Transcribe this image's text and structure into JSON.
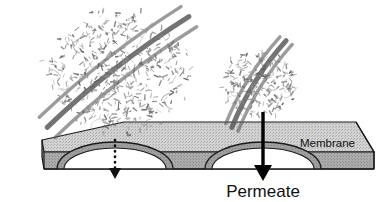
{
  "figure": {
    "labels": {
      "membrane": "Membrane",
      "permeate": "Permeate"
    },
    "colors": {
      "background": "#ffffff",
      "slab_top_face": "#cfcfcf",
      "slab_front_edge": "#a8a8a8",
      "slab_pore_band": "#9a9a9a",
      "outline": "#1a1a1a",
      "molecule": "#8d8d8d",
      "molecule_core": "#5a5a5a",
      "arrow_solid": "#000000",
      "arrow_dotted": "#111111",
      "pore_opening": "#ffffff"
    },
    "slab": {
      "name": "membrane-slab",
      "top_face_points": "42,140 124,122 356,122 374,152 44,152",
      "front_edge_height": 17,
      "stipple_on": true
    },
    "pores": [
      {
        "name": "pore-left",
        "label": "blocked pore",
        "center_x": 115,
        "arch_half_width": 58,
        "arch_height": 27,
        "base_y": 169,
        "flow": "blocked"
      },
      {
        "name": "pore-right",
        "label": "permeating pore",
        "center_x": 263,
        "arch_half_width": 58,
        "arch_height": 27,
        "base_y": 169,
        "flow": "permeate"
      }
    ],
    "arrows": [
      {
        "name": "dotted-arrow",
        "style": "dotted",
        "direction": "down",
        "x": 115,
        "y_start": 140,
        "y_end": 176,
        "meaning": "restricted flow"
      },
      {
        "name": "permeate-arrow",
        "style": "solid",
        "direction": "down",
        "x": 263,
        "y_start": 112,
        "y_end": 179,
        "meaning": "permeate flow"
      }
    ],
    "molecules": [
      {
        "name": "large-macromolecule",
        "role": "rejected",
        "center_x": 118,
        "center_y": 72,
        "radius_x": 68,
        "radius_y": 58,
        "core_angle_deg": -38,
        "branch_count": 520
      },
      {
        "name": "small-macromolecule",
        "role": "near-pore",
        "center_x": 259,
        "center_y": 84,
        "radius_x": 34,
        "radius_y": 33,
        "core_angle_deg": -58,
        "branch_count": 230
      }
    ]
  }
}
